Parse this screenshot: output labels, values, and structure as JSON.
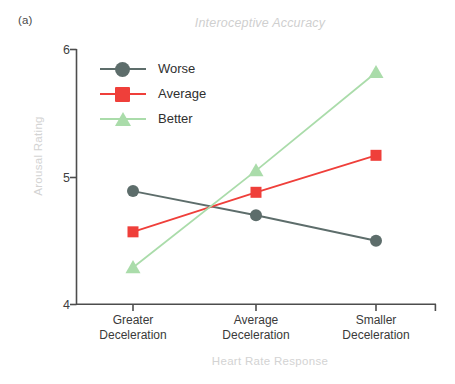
{
  "panel": {
    "label": "(a)"
  },
  "chart_data": {
    "type": "line",
    "title": "Interoceptive Accuracy",
    "xlabel": "Heart Rate Response",
    "ylabel": "Arousal Rating",
    "categories": [
      "Greater Deceleration",
      "Average Deceleration",
      "Smaller Deceleration"
    ],
    "category_lines": [
      [
        "Greater",
        "Deceleration"
      ],
      [
        "Average",
        "Deceleration"
      ],
      [
        "Smaller",
        "Deceleration"
      ]
    ],
    "ylim": [
      4,
      6
    ],
    "yticks": [
      "4",
      "5",
      "6"
    ],
    "ytick_values": [
      4,
      5,
      6
    ],
    "grid": false,
    "legend_position": "upper-left-inside",
    "series": [
      {
        "name": "Worse",
        "color": "#5d6d6b",
        "marker": "circle",
        "values": [
          4.89,
          4.7,
          4.5
        ]
      },
      {
        "name": "Average",
        "color": "#ef3f3a",
        "marker": "square",
        "values": [
          4.57,
          4.88,
          5.17
        ]
      },
      {
        "name": "Better",
        "color": "#aadcaa",
        "marker": "triangle",
        "values": [
          4.29,
          5.05,
          5.82
        ]
      }
    ]
  },
  "style": {
    "axis_color": "#4d4d4d",
    "title_color": "#cfcfcf",
    "axis_label_color": "#d3d3d3",
    "tick_color": "#3a3a3a",
    "background": "#ffffff"
  }
}
